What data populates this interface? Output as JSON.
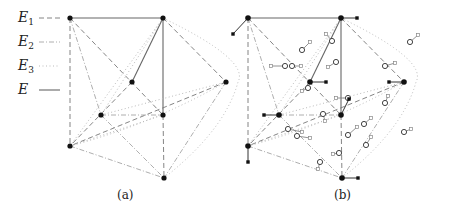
{
  "legend": [
    {
      "symbol": "E",
      "sub": "1",
      "style": "E1"
    },
    {
      "symbol": "E",
      "sub": "2",
      "style": "E2"
    },
    {
      "symbol": "E",
      "sub": "3",
      "style": "E3"
    },
    {
      "symbol": "E",
      "sub": "",
      "style": "E"
    }
  ],
  "styles": {
    "E": {
      "stroke": "#666666",
      "dash": "",
      "width": 1.1
    },
    "E1": {
      "stroke": "#777777",
      "dash": "5 3",
      "width": 0.9
    },
    "E2": {
      "stroke": "#999999",
      "dash": "5 2 1 2",
      "width": 0.8
    },
    "E3": {
      "stroke": "#bbbbbb",
      "dash": "1 2.5",
      "width": 1.0
    }
  },
  "captions": {
    "a": "(a)",
    "b": "(b)"
  },
  "panel_a": {
    "nodes": {
      "TL": [
        70,
        18
      ],
      "TR": [
        163,
        18
      ],
      "C": [
        132,
        82
      ],
      "R": [
        226,
        82
      ],
      "ML": [
        101,
        115
      ],
      "MR": [
        163,
        115
      ],
      "BL": [
        70,
        146
      ],
      "B": [
        164,
        178
      ]
    },
    "edges": [
      {
        "from": "TL",
        "to": "TR",
        "style": "E"
      },
      {
        "from": "TR",
        "to": "C",
        "style": "E"
      },
      {
        "from": "TR",
        "to": "MR",
        "style": "E"
      },
      {
        "from": "TL",
        "to": "BL",
        "style": "E1"
      },
      {
        "from": "TL",
        "to": "MR",
        "style": "E1"
      },
      {
        "from": "TR",
        "to": "R",
        "style": "E1"
      },
      {
        "from": "C",
        "to": "BL",
        "style": "E1"
      },
      {
        "from": "R",
        "to": "BL",
        "style": "E1"
      },
      {
        "from": "MR",
        "to": "B",
        "style": "E1"
      },
      {
        "from": "TL",
        "to": "ML",
        "style": "E2"
      },
      {
        "from": "ML",
        "to": "MR",
        "style": "E2"
      },
      {
        "from": "ML",
        "to": "B",
        "style": "E2"
      },
      {
        "from": "BL",
        "to": "B",
        "style": "E2"
      },
      {
        "from": "R",
        "to": "B",
        "style": "E2"
      },
      {
        "from": "TR",
        "to": "ML",
        "style": "E3"
      },
      {
        "from": "TR",
        "to": "BL",
        "style": "E3"
      },
      {
        "from": "BL",
        "to": "MR",
        "style": "E3"
      },
      {
        "from": "ML",
        "to": "R",
        "style": "E3"
      }
    ],
    "curves": [
      {
        "d": "M163 18 Q250 60 238 82 Q225 130 164 178",
        "style": "E3"
      },
      {
        "d": "M70 146 Q150 125 226 82",
        "style": "E3"
      }
    ]
  },
  "panel_b": {
    "offset": [
      178,
      0
    ],
    "stubs_filled": [
      {
        "at": "TL",
        "to": [
          -15,
          16
        ]
      },
      {
        "at": "TR",
        "to": [
          16,
          0
        ]
      },
      {
        "at": "C",
        "to": [
          16,
          0
        ]
      },
      {
        "at": "R",
        "to": [
          -15,
          0
        ]
      },
      {
        "at": "ML",
        "to": [
          -15,
          0
        ]
      },
      {
        "at": "MR",
        "to": [
          8,
          -16
        ]
      },
      {
        "at": "BL",
        "to": [
          0,
          16
        ]
      },
      {
        "at": "B",
        "to": [
          16,
          0
        ]
      }
    ],
    "stubs_hollow": [
      [
        302,
        50,
        310,
        42
      ],
      [
        332,
        41,
        326,
        34
      ],
      [
        285,
        66,
        271,
        66
      ],
      [
        292,
        66,
        301,
        66
      ],
      [
        336,
        62,
        328,
        67
      ],
      [
        308,
        88,
        302,
        91
      ],
      [
        348,
        98,
        336,
        98
      ],
      [
        385,
        66,
        395,
        63
      ],
      [
        410,
        42,
        418,
        35
      ],
      [
        385,
        103,
        388,
        96
      ],
      [
        323,
        114,
        325,
        121
      ],
      [
        288,
        129,
        302,
        132
      ],
      [
        297,
        136,
        310,
        138
      ],
      [
        348,
        135,
        357,
        127
      ],
      [
        364,
        124,
        371,
        118
      ],
      [
        404,
        132,
        411,
        129
      ],
      [
        366,
        145,
        371,
        137
      ],
      [
        339,
        153,
        333,
        154
      ],
      [
        320,
        162,
        318,
        169
      ]
    ]
  }
}
